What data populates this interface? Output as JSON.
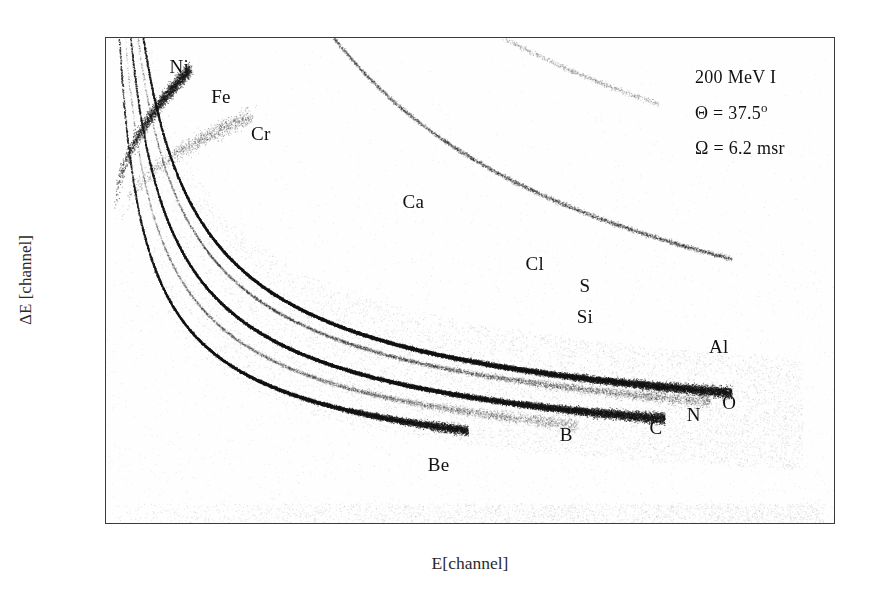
{
  "chart_data": {
    "type": "scatter",
    "title": "",
    "xlabel": "E[channel]",
    "ylabel": "ΔE [channel]",
    "xlim": [
      1,
      350
    ],
    "ylim": [
      1,
      500
    ],
    "xticks": [
      1,
      100,
      200,
      300,
      350
    ],
    "xticklabels": [
      "1",
      "100",
      "200",
      "300",
      "350"
    ],
    "xminorticks": [
      50,
      150,
      250
    ],
    "yticks": [
      1,
      200,
      400,
      500
    ],
    "yticklabels": [
      "1",
      "200",
      "400",
      "500"
    ],
    "yminorticks": [
      50,
      100,
      150,
      250,
      300,
      350,
      450
    ],
    "grid": false,
    "legend": "none",
    "point_labels": [
      {
        "text": "Ni",
        "x": 36,
        "y": 470
      },
      {
        "text": "Fe",
        "x": 56,
        "y": 440
      },
      {
        "text": "Cr",
        "x": 75,
        "y": 402
      },
      {
        "text": "Ca",
        "x": 148,
        "y": 332
      },
      {
        "text": "Cl",
        "x": 206,
        "y": 268
      },
      {
        "text": "S",
        "x": 230,
        "y": 246
      },
      {
        "text": "Si",
        "x": 230,
        "y": 214
      },
      {
        "text": "Al",
        "x": 294,
        "y": 183
      },
      {
        "text": "O",
        "x": 299,
        "y": 126
      },
      {
        "text": "N",
        "x": 282,
        "y": 114
      },
      {
        "text": "C",
        "x": 264,
        "y": 100
      },
      {
        "text": "B",
        "x": 221,
        "y": 93
      },
      {
        "text": "Be",
        "x": 160,
        "y": 62
      }
    ],
    "series": [
      {
        "name": "Be",
        "intensity": "dense",
        "points_hint": "lowest dense band, ends near E=170"
      },
      {
        "name": "B",
        "intensity": "medium",
        "points_hint": "faint band above Be"
      },
      {
        "name": "C",
        "intensity": "dense",
        "points_hint": "second dense band, extends to E=265"
      },
      {
        "name": "N",
        "intensity": "medium",
        "points_hint": "faint band between C and O"
      },
      {
        "name": "O",
        "intensity": "dense",
        "points_hint": "topmost dense band, extends to E=300"
      },
      {
        "name": "Al",
        "intensity": "sparse"
      },
      {
        "name": "Si",
        "intensity": "sparse"
      },
      {
        "name": "S",
        "intensity": "sparse"
      },
      {
        "name": "Cl",
        "intensity": "sparse"
      },
      {
        "name": "Ca",
        "intensity": "sparse"
      },
      {
        "name": "Cr",
        "intensity": "sparse"
      },
      {
        "name": "Fe",
        "intensity": "sparse"
      },
      {
        "name": "Ni",
        "intensity": "sparse-cluster",
        "points_hint": "steep cluster near left edge, ΔE 330-460"
      }
    ]
  },
  "annotation": {
    "beam": "200 MeV I",
    "angle_symbol": "Θ",
    "angle_text": "Θ = 37.5",
    "angle_unit": "o",
    "solid_angle_text": "Ω = 6.2 msr"
  },
  "colors": {
    "axis": "#3a3a3a",
    "tick_label": "#4a4a4a",
    "text": "#111111",
    "background": "#ffffff",
    "data": "#1a1a1a"
  }
}
